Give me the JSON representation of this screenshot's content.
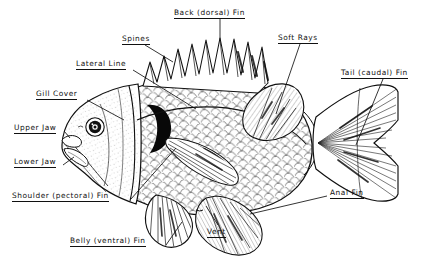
{
  "figure": {
    "style": "black-and-white line engraving with underlined leader labels",
    "background_color": "#ffffff",
    "ink_color": "#101010",
    "width": 440,
    "height": 269
  },
  "labels": [
    {
      "id": "back-dorsal-fin",
      "text": "Back (dorsal) Fin",
      "x": 174,
      "y": 8,
      "leader": "vertical down to dorsal fin ridge"
    },
    {
      "id": "spines",
      "text": "Spines",
      "x": 122,
      "y": 34,
      "leader": "diagonal down-right to spiny dorsal rays"
    },
    {
      "id": "lateral-line",
      "text": "Lateral Line",
      "x": 76,
      "y": 59,
      "leader": "diagonal down-right to lateral line on flank"
    },
    {
      "id": "gill-cover",
      "text": "Gill Cover",
      "x": 36,
      "y": 89,
      "leader": "diagonal down-right to operculum"
    },
    {
      "id": "upper-jaw",
      "text": "Upper Jaw",
      "x": 14,
      "y": 123,
      "leader": "horizontal right to upper jaw"
    },
    {
      "id": "lower-jaw",
      "text": "Lower Jaw",
      "x": 14,
      "y": 157,
      "leader": "horizontal right to lower jaw"
    },
    {
      "id": "shoulder-pectoral-fin",
      "text": "Shoulder (pectoral) Fin",
      "x": 12,
      "y": 191,
      "leader": "horizontal right to pectoral fin base"
    },
    {
      "id": "belly-ventral-fin",
      "text": "Belly (ventral) Fin",
      "x": 70,
      "y": 236,
      "leader": "diagonal up-right to pelvic fin"
    },
    {
      "id": "vent",
      "text": "Vent",
      "x": 207,
      "y": 227,
      "leader": "vertical up to vent"
    },
    {
      "id": "soft-rays",
      "text": "Soft Rays",
      "x": 278,
      "y": 33,
      "leader": "vertical down to soft dorsal rays"
    },
    {
      "id": "tail-caudal-fin",
      "text": "Tail (caudal) Fin",
      "x": 341,
      "y": 68,
      "leader": "diagonal down-left to caudal fin"
    },
    {
      "id": "anal-fin",
      "text": "Anal Fin",
      "x": 330,
      "y": 188,
      "leader": "horizontal left to anal fin"
    }
  ],
  "parts": [
    {
      "name": "dorsal-fin-spiny",
      "description": "spiny front portion of dorsal fin, about 10 sharp spines"
    },
    {
      "name": "dorsal-fin-soft",
      "description": "rounded rear portion of dorsal fin with soft rays"
    },
    {
      "name": "caudal-fin",
      "description": "forked tail fin with radiating rays"
    },
    {
      "name": "anal-fin",
      "description": "rounded fin on ventral side behind the vent"
    },
    {
      "name": "pelvic-fin",
      "description": "ventral (belly) fin below the pectoral"
    },
    {
      "name": "pectoral-fin",
      "description": "shoulder fin on the side behind the gill cover"
    },
    {
      "name": "operculum",
      "description": "gill cover plate with dark opercular spot"
    },
    {
      "name": "eye",
      "description": "round eye with dark pupil and highlight"
    },
    {
      "name": "lateral-line",
      "description": "curved sensory line running along the flank"
    },
    {
      "name": "scales",
      "description": "overlapping scale pattern covering the body"
    },
    {
      "name": "vent",
      "description": "opening on the belly just ahead of the anal fin"
    }
  ]
}
